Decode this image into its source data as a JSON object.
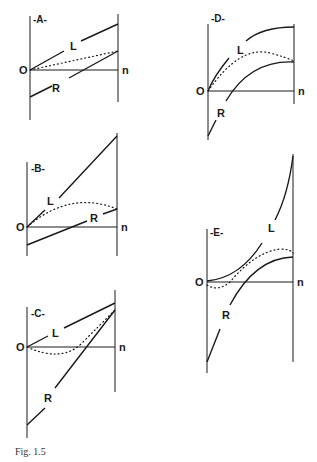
{
  "header_fragment": "...  ·  ·  ·  ·  ·  ·",
  "caption": "Fig. 1.5",
  "panels": [
    {
      "id": "A",
      "title": "-A-",
      "origin_label": "O",
      "end_label": "n",
      "curve_labels": [
        "L",
        "R"
      ]
    },
    {
      "id": "B",
      "title": "-B-",
      "origin_label": "O",
      "end_label": "n",
      "curve_labels": [
        "L",
        "R"
      ]
    },
    {
      "id": "C",
      "title": "-C-",
      "origin_label": "O",
      "end_label": "n",
      "curve_labels": [
        "L",
        "R"
      ]
    },
    {
      "id": "D",
      "title": "-D-",
      "origin_label": "O",
      "end_label": "n",
      "curve_labels": [
        "L",
        "R"
      ]
    },
    {
      "id": "E",
      "title": "-E-",
      "origin_label": "O",
      "end_label": "n",
      "curve_labels": [
        "L",
        "R"
      ]
    }
  ],
  "legend_note": {
    "solid_upper": "L",
    "solid_lower": "R",
    "dotted": "average of L and R"
  }
}
